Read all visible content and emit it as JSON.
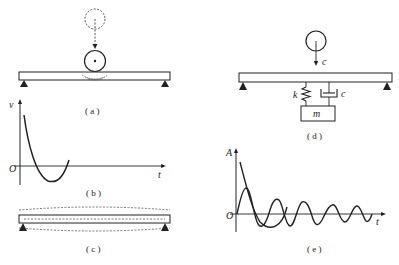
{
  "panels": {
    "a": {
      "caption": "( a )"
    },
    "b": {
      "caption": "( b )",
      "y_axis": "v",
      "x_axis": "t",
      "origin": "O"
    },
    "c": {
      "caption": "( c )"
    },
    "d": {
      "caption": "( d )",
      "spring_label": "k",
      "damper_label": "c",
      "mass_label": "m",
      "velocity_label": "c"
    },
    "e": {
      "caption": "( e )",
      "y_axis": "A",
      "x_axis": "t",
      "origin": "O"
    }
  },
  "colors": {
    "line": "#222222",
    "background": "#ffffff"
  }
}
